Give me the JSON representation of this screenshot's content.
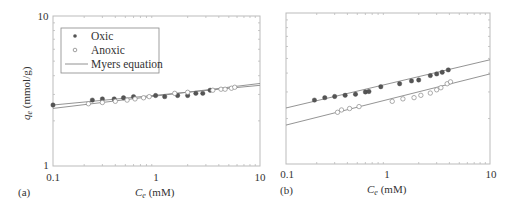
{
  "figure": {
    "panels": [
      "(a)",
      "(b)"
    ]
  },
  "chart_data": [
    {
      "panel": "(a)",
      "type": "scatter",
      "xscale": "log",
      "yscale": "log",
      "xlabel": "C_e (mM)",
      "ylabel": "q_e (mmol/g)",
      "xlim": [
        0.1,
        10
      ],
      "ylim": [
        1,
        10
      ],
      "xticks": [
        "0.1",
        "1",
        "10"
      ],
      "yticks": [
        "1",
        "10"
      ],
      "legend": {
        "position": "upper left",
        "entries": [
          "Oxic",
          "Anoxic",
          "Myers equation"
        ]
      },
      "series": [
        {
          "name": "Oxic",
          "marker": "filled-circle",
          "x": [
            0.1,
            0.24,
            0.3,
            0.39,
            0.48,
            0.6,
            0.98,
            1.2,
            1.6,
            2.0,
            2.4,
            2.8,
            3.3
          ],
          "y": [
            2.55,
            2.75,
            2.8,
            2.8,
            2.85,
            2.9,
            2.95,
            2.9,
            2.95,
            2.95,
            3.05,
            3.05,
            3.2
          ]
        },
        {
          "name": "Anoxic",
          "marker": "open-circle",
          "x": [
            0.22,
            0.3,
            0.4,
            0.52,
            0.62,
            0.75,
            0.85,
            1.5,
            2.0,
            3.5,
            4.2,
            4.6,
            5.3,
            5.7
          ],
          "y": [
            2.6,
            2.65,
            2.7,
            2.75,
            2.8,
            2.85,
            2.9,
            3.05,
            3.1,
            3.2,
            3.25,
            3.25,
            3.3,
            3.35
          ]
        },
        {
          "name": "Myers equation (Oxic)",
          "type": "line",
          "x": [
            0.1,
            10
          ],
          "y": [
            2.55,
            3.45
          ]
        },
        {
          "name": "Myers equation (Anoxic)",
          "type": "line",
          "x": [
            0.1,
            10
          ],
          "y": [
            2.42,
            3.55
          ]
        }
      ]
    },
    {
      "panel": "(b)",
      "type": "scatter",
      "xscale": "log",
      "yscale": "log",
      "xlabel": "C_e (mM)",
      "ylabel": "",
      "xlim": [
        0.1,
        10
      ],
      "ylim": [
        1,
        10
      ],
      "xticks": [
        "0.1",
        "1",
        "10"
      ],
      "yticks": [],
      "series": [
        {
          "name": "Oxic",
          "marker": "filled-circle",
          "x": [
            0.19,
            0.24,
            0.3,
            0.38,
            0.48,
            0.6,
            0.65,
            0.85,
            1.3,
            1.7,
            2.0,
            2.6,
            3.0,
            3.4,
            3.9
          ],
          "y": [
            2.65,
            2.75,
            2.8,
            2.85,
            2.9,
            3.0,
            3.02,
            3.25,
            3.4,
            3.55,
            3.6,
            3.85,
            3.95,
            4.05,
            4.2
          ]
        },
        {
          "name": "Anoxic",
          "marker": "open-circle",
          "x": [
            0.32,
            0.35,
            0.42,
            0.52,
            1.1,
            1.4,
            1.8,
            2.1,
            2.6,
            3.0,
            3.3,
            3.8,
            4.1
          ],
          "y": [
            2.2,
            2.28,
            2.33,
            2.4,
            2.6,
            2.7,
            2.75,
            2.85,
            2.95,
            3.1,
            3.2,
            3.4,
            3.5
          ]
        },
        {
          "name": "Myers equation (Oxic)",
          "type": "line",
          "x": [
            0.1,
            10
          ],
          "y": [
            2.35,
            4.9
          ]
        },
        {
          "name": "Myers equation (Anoxic)",
          "type": "line",
          "x": [
            0.1,
            10
          ],
          "y": [
            1.81,
            3.95
          ]
        }
      ]
    }
  ],
  "axes": {
    "a": {
      "xticks": [
        "0.1",
        "1",
        "10"
      ],
      "yticks": [
        "1",
        "10"
      ],
      "xlabel_main": "C",
      "xlabel_sub": "e",
      "xlabel_unit": " (mM)",
      "ylabel_main": "q",
      "ylabel_sub": "e",
      "ylabel_unit": " (mmol/g)",
      "panel_label": "(a)"
    },
    "b": {
      "xticks": [
        "0.1",
        "1",
        "10"
      ],
      "xlabel_main": "C",
      "xlabel_sub": "e",
      "xlabel_unit": " (mM)",
      "panel_label": "(b)"
    }
  },
  "legend": {
    "oxic": "Oxic",
    "anoxic": "Anoxic",
    "myers": "Myers equation"
  }
}
